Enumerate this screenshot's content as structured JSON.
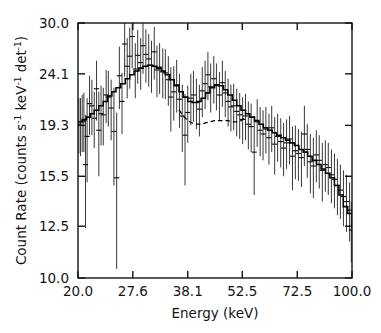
{
  "figure": {
    "background": "#ffffff",
    "foreground": "#141414"
  },
  "chart_data": {
    "type": "line",
    "title": "",
    "subtitle": "",
    "xlabel": "Energy (keV)",
    "ylabel": "Count Rate (counts s⁻¹ keV⁻¹ det⁻¹)",
    "ylabel_parts": {
      "prefix": "Count Rate (counts s",
      "sup1": "-1",
      "mid1": " keV",
      "sup2": "-1",
      "mid2": " det",
      "sup3": "-1",
      "suffix": ")"
    },
    "xscale": "log",
    "yscale": "log",
    "xlim": [
      20.0,
      100.0
    ],
    "ylim": [
      10.0,
      30.0
    ],
    "grid": false,
    "legend": null,
    "xticks": [
      20.0,
      27.6,
      38.1,
      52.5,
      72.5,
      100.0
    ],
    "xtick_labels": [
      "20.0",
      "27.6",
      "38.1",
      "52.5",
      "72.5",
      "100.0"
    ],
    "yticks": [
      10.0,
      12.5,
      15.5,
      19.3,
      24.1,
      30.0
    ],
    "ytick_labels": [
      "10.0",
      "12.5",
      "15.5",
      "19.3",
      "24.1",
      "30.0"
    ],
    "series": [
      {
        "name": "model",
        "style": "solid-histogram",
        "color": "#000000",
        "x": [
          20.0,
          20.5,
          21.0,
          21.5,
          22.0,
          22.6,
          23.2,
          23.8,
          24.4,
          25.0,
          25.7,
          26.4,
          27.1,
          27.8,
          28.6,
          29.3,
          30.1,
          30.9,
          31.7,
          32.6,
          33.4,
          34.3,
          35.2,
          36.2,
          37.1,
          38.1,
          39.1,
          40.2,
          41.2,
          42.3,
          43.4,
          44.6,
          45.8,
          47.0,
          48.2,
          49.5,
          50.8,
          52.1,
          53.5,
          54.9,
          56.4,
          57.9,
          59.4,
          61.0,
          62.6,
          64.2,
          65.9,
          67.7,
          69.4,
          71.3,
          73.2,
          75.1,
          77.1,
          79.1,
          81.2,
          83.4,
          85.6,
          87.8,
          90.2,
          92.6,
          95.0,
          97.5,
          100.0
        ],
        "y": [
          19.6,
          19.8,
          20.0,
          20.3,
          20.6,
          21.0,
          21.4,
          21.9,
          22.3,
          22.7,
          23.1,
          23.6,
          24.0,
          24.4,
          24.7,
          24.9,
          25.0,
          24.9,
          24.7,
          24.4,
          24.0,
          23.5,
          22.9,
          22.3,
          21.8,
          21.4,
          21.3,
          21.4,
          21.7,
          22.2,
          22.7,
          23.0,
          22.9,
          22.5,
          22.0,
          21.5,
          21.0,
          20.6,
          20.3,
          20.0,
          19.7,
          19.4,
          19.1,
          18.9,
          18.7,
          18.5,
          18.3,
          18.1,
          17.9,
          17.7,
          17.4,
          17.2,
          16.9,
          16.6,
          16.3,
          16.0,
          15.7,
          15.4,
          14.9,
          14.3,
          13.6,
          13.2,
          12.2
        ]
      },
      {
        "name": "continuum",
        "style": "dashed",
        "color": "#000000",
        "x": [
          36.2,
          37.1,
          38.1,
          39.1,
          40.2,
          41.2,
          42.3,
          43.4,
          44.6,
          45.8,
          47.0,
          48.2,
          49.5,
          50.8,
          52.1,
          53.5
        ],
        "y": [
          20.6,
          20.1,
          19.7,
          19.5,
          19.4,
          19.4,
          19.5,
          19.6,
          19.7,
          19.7,
          19.7,
          19.7,
          19.6,
          19.6,
          19.7,
          20.0
        ]
      }
    ],
    "data_points": {
      "name": "observed-counts",
      "style": "errorbar",
      "color": "#1a1a1a",
      "x": [
        20.1,
        20.3,
        20.5,
        20.7,
        20.9,
        21.1,
        21.4,
        21.7,
        22.0,
        22.3,
        22.6,
        22.9,
        23.2,
        23.6,
        23.9,
        24.3,
        24.7,
        25.1,
        25.5,
        25.9,
        26.3,
        26.7,
        27.1,
        27.5,
        28.0,
        28.4,
        28.9,
        29.3,
        29.8,
        30.3,
        30.8,
        31.3,
        31.8,
        32.3,
        32.9,
        33.4,
        34.0,
        34.5,
        35.1,
        35.7,
        36.3,
        36.9,
        37.5,
        38.1,
        38.8,
        39.4,
        40.1,
        40.8,
        41.5,
        42.2,
        42.9,
        43.6,
        44.4,
        45.1,
        45.9,
        46.7,
        47.5,
        48.3,
        49.1,
        49.9,
        50.8,
        51.7,
        52.6,
        53.5,
        54.4,
        55.3,
        56.3,
        57.3,
        58.3,
        59.3,
        60.3,
        61.4,
        62.4,
        63.5,
        64.6,
        65.8,
        66.9,
        68.1,
        69.3,
        70.5,
        71.7,
        73.0,
        74.3,
        75.6,
        76.9,
        78.3,
        79.7,
        81.1,
        82.5,
        84.0,
        85.5,
        87.0,
        88.6,
        90.2,
        91.8,
        93.4,
        95.1,
        96.8,
        98.6,
        99.6
      ],
      "y": [
        19.4,
        19.3,
        19.6,
        19.7,
        16.3,
        18.4,
        21.2,
        21.0,
        19.9,
        22.6,
        18.9,
        20.3,
        20.2,
        22.0,
        21.8,
        20.8,
        18.8,
        15.4,
        23.9,
        21.4,
        27.4,
        24.9,
        26.0,
        28.3,
        24.6,
        26.1,
        25.3,
        27.2,
        26.2,
        25.7,
        25.0,
        26.5,
        24.5,
        24.8,
        24.3,
        24.2,
        23.5,
        21.8,
        22.3,
        23.0,
        21.6,
        20.1,
        18.5,
        20.4,
        21.7,
        22.0,
        21.3,
        20.7,
        22.4,
        23.1,
        24.0,
        22.8,
        23.6,
        22.9,
        22.0,
        23.2,
        22.2,
        21.4,
        20.9,
        21.0,
        20.5,
        20.2,
        19.8,
        20.1,
        19.4,
        19.2,
        17.2,
        19.6,
        18.9,
        18.6,
        19.0,
        18.3,
        19.1,
        17.8,
        18.4,
        18.0,
        17.5,
        17.9,
        18.2,
        16.9,
        17.3,
        17.1,
        16.8,
        18.6,
        17.4,
        16.5,
        16.2,
        17.0,
        16.6,
        15.9,
        16.3,
        16.1,
        15.6,
        15.3,
        14.9,
        14.6,
        14.2,
        13.9,
        13.4,
        12.3
      ],
      "yerr": [
        2.3,
        2.4,
        2.4,
        2.5,
        3.9,
        3.3,
        2.7,
        2.5,
        2.4,
        2.9,
        3.4,
        2.6,
        2.5,
        2.5,
        2.6,
        2.7,
        3.9,
        5.0,
        3.2,
        2.8,
        3.6,
        3.2,
        3.4,
        3.6,
        2.9,
        3.0,
        2.8,
        3.1,
        3.0,
        2.9,
        2.8,
        3.0,
        2.7,
        2.7,
        2.6,
        2.6,
        2.5,
        3.0,
        2.6,
        2.6,
        2.5,
        2.9,
        3.6,
        2.5,
        2.4,
        2.4,
        2.3,
        2.3,
        2.4,
        2.4,
        2.5,
        2.4,
        2.4,
        2.3,
        2.3,
        2.3,
        2.2,
        2.2,
        2.1,
        2.1,
        2.1,
        2.0,
        2.0,
        2.0,
        2.0,
        2.0,
        2.9,
        2.0,
        2.0,
        2.0,
        1.9,
        2.0,
        1.9,
        2.2,
        1.9,
        1.9,
        2.0,
        1.9,
        1.9,
        2.3,
        2.0,
        1.9,
        2.0,
        2.4,
        2.0,
        2.1,
        2.1,
        1.9,
        1.9,
        2.0,
        1.8,
        1.8,
        1.8,
        1.8,
        1.8,
        1.7,
        1.7,
        1.7,
        1.7,
        1.6
      ]
    }
  }
}
